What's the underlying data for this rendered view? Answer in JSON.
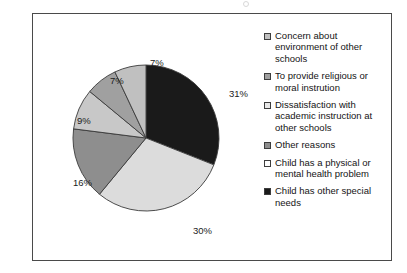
{
  "chart_data": {
    "type": "pie",
    "title": "",
    "categories": [
      "Child has other special needs",
      "Child has a physical or mental health problem",
      "Other reasons",
      "Dissatisfaction with academic instruction at other schools",
      "To provide religious or moral instrution",
      "Concern about environment of other schools"
    ],
    "values": [
      31,
      30,
      16,
      9,
      7,
      7
    ],
    "value_labels": [
      "31%",
      "30%",
      "16%",
      "9%",
      "7%",
      "7%"
    ],
    "colors": [
      "#1a1a1a",
      "#dcdcdc",
      "#8e8e8e",
      "#c8c8c8",
      "#a0a0a0",
      "#c0c0c0"
    ],
    "start_angle_deg": 0,
    "direction": "clockwise",
    "legend_position": "right",
    "grid": false,
    "xlabel": "",
    "ylabel": ""
  },
  "slice_labels": [
    {
      "text": "31%",
      "left": 196,
      "top": 74
    },
    {
      "text": "30%",
      "left": 160,
      "top": 211
    },
    {
      "text": "16%",
      "left": 40,
      "top": 163
    },
    {
      "text": "9%",
      "left": 44,
      "top": 101
    },
    {
      "text": "7%",
      "left": 77,
      "top": 61
    },
    {
      "text": "7%",
      "left": 117,
      "top": 43
    }
  ],
  "legend": {
    "items": [
      {
        "label": "Concern about environment of other schools",
        "color": "#c0c0c0"
      },
      {
        "label": "To provide religious or moral instrution",
        "color": "#a0a0a0"
      },
      {
        "label": "Dissatisfaction with academic instruction at other schools",
        "color": "#e8e8e8"
      },
      {
        "label": "Other reasons",
        "color": "#8e8e8e"
      },
      {
        "label": "Child has a physical or mental health problem",
        "color": "#fdfdfd"
      },
      {
        "label": "Child has other special needs",
        "color": "#1a1a1a"
      }
    ]
  }
}
